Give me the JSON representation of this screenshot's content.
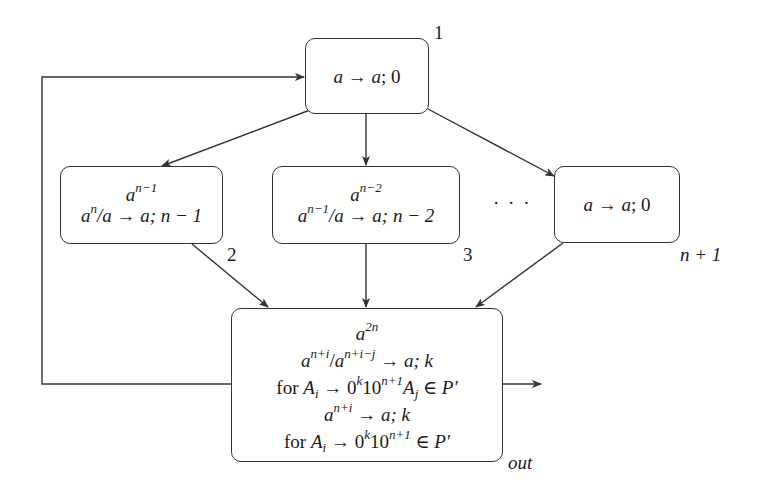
{
  "diagram": {
    "type": "spiking-neural-p-system",
    "neurons": [
      {
        "id": "1",
        "label": "1",
        "spikes": "",
        "rules": [
          "a → a; 0"
        ]
      },
      {
        "id": "2",
        "label": "2",
        "spikes": "a^{n-1}",
        "rules": [
          "a^n/a → a; n − 1"
        ]
      },
      {
        "id": "3",
        "label": "3",
        "spikes": "a^{n-2}",
        "rules": [
          "a^{n-1}/a → a; n − 2"
        ]
      },
      {
        "id": "n+1",
        "label": "n + 1",
        "spikes": "",
        "rules": [
          "a → a; 0"
        ]
      },
      {
        "id": "out",
        "label": "out",
        "spikes": "a^{2n}",
        "rules": [
          "a^{n+i}/a^{n+i-j} → a; k",
          "for A_i → 0^k 10^{n+1} A_j ∈ P′",
          "a^{n+i} → a; k",
          "for A_i → 0^k 10^{n+1} ∈ P′"
        ]
      }
    ],
    "ellipsis": "· · ·",
    "edges": [
      {
        "from": "1",
        "to": "2"
      },
      {
        "from": "1",
        "to": "3"
      },
      {
        "from": "1",
        "to": "n+1"
      },
      {
        "from": "2",
        "to": "out"
      },
      {
        "from": "3",
        "to": "out"
      },
      {
        "from": "n+1",
        "to": "out"
      },
      {
        "from": "out",
        "to": "1"
      },
      {
        "from": "out",
        "to": "environment"
      }
    ]
  },
  "labels": {
    "n1": "1",
    "n2": "2",
    "n3": "3",
    "nn1": "n + 1",
    "nout": "out",
    "dots": "· · ·"
  },
  "text": {
    "a": "a",
    "arrow": " → ",
    "semi0": "; 0",
    "n": "n",
    "nm1": "n−1",
    "nm2": "n−2",
    "slash_a": "/a",
    "semi_nm1": "; n − 1",
    "semi_nm2": "; n − 2",
    "two_n": "2n",
    "npi": "n+i",
    "npimj": "n+i−j",
    "slash": "/",
    "semik": "; k",
    "for": "for ",
    "A": "A",
    "i": "i",
    "j": "j",
    "zero": "0",
    "k": "k",
    "ten": "10",
    "np1": "n+1",
    "inP": " ∈ P′"
  },
  "colors": {
    "stroke": "#333333",
    "text": "#1a1a1a",
    "background": "#ffffff"
  }
}
